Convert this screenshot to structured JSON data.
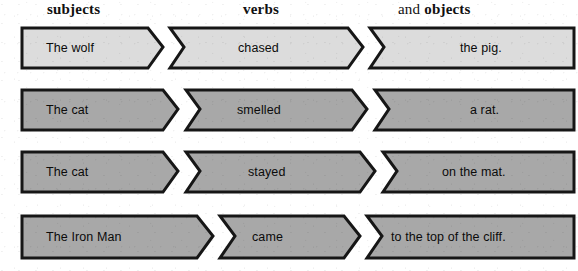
{
  "page": {
    "background_color": "#ffffff",
    "width": 578,
    "height": 271
  },
  "headers": {
    "subjects": "subjects",
    "verbs": "verbs",
    "objects_prefix": "and ",
    "objects": "objects"
  },
  "colors": {
    "piece_light_fill": "#dcdcdc",
    "piece_dark_fill": "#a8a8a8",
    "piece_outline": "#161616",
    "text": "#0b0b0b",
    "header_text": "#111111"
  },
  "rows": [
    {
      "id": "row-1",
      "fill": "#dcdcdc",
      "sentence": "The wolf chased the pig.",
      "pieces": [
        {
          "role": "subject",
          "text": "The wolf"
        },
        {
          "role": "verb",
          "text": "chased"
        },
        {
          "role": "object",
          "text": "the pig."
        }
      ]
    },
    {
      "id": "row-2",
      "fill": "#a8a8a8",
      "sentence": "The cat smelled a rat.",
      "pieces": [
        {
          "role": "subject",
          "text": "The cat"
        },
        {
          "role": "verb",
          "text": "smelled"
        },
        {
          "role": "object",
          "text": "a rat."
        }
      ]
    },
    {
      "id": "row-3",
      "fill": "#a8a8a8",
      "sentence": "The cat stayed on the mat.",
      "pieces": [
        {
          "role": "subject",
          "text": "The cat"
        },
        {
          "role": "verb",
          "text": "stayed"
        },
        {
          "role": "object",
          "text": "on the mat."
        }
      ]
    },
    {
      "id": "row-4",
      "fill": "#a8a8a8",
      "sentence": "The Iron Man came to the top of the cliff.",
      "pieces": [
        {
          "role": "subject",
          "text": "The Iron Man"
        },
        {
          "role": "verb",
          "text": "came"
        },
        {
          "role": "object",
          "text": "to the top of the cliff."
        }
      ]
    }
  ]
}
